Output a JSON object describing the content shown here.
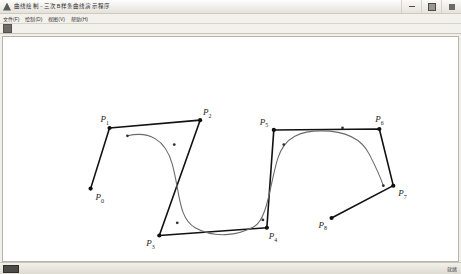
{
  "window": {
    "title": "曲线绘制 - 三次B样条曲线演示程序",
    "icon": "app-triangle-icon",
    "buttons": {
      "minimize": "最小化",
      "maximize": "最大化",
      "close": "关闭"
    }
  },
  "menubar": {
    "items": [
      {
        "label": "文件(F)",
        "name": "menu-file"
      },
      {
        "label": "绘制(D)",
        "name": "menu-draw"
      },
      {
        "label": "视图(V)",
        "name": "menu-view"
      },
      {
        "label": "帮助(H)",
        "name": "menu-help"
      }
    ]
  },
  "toolbar": {
    "buttons": [
      {
        "label": "绘制工具",
        "name": "toolbar-draw-tool"
      }
    ]
  },
  "statusbar": {
    "indicator_label": "",
    "right_text": "就绪"
  },
  "chart_data": {
    "type": "scatter",
    "title": "",
    "xlabel": "",
    "ylabel": "",
    "grid": false,
    "legend": null,
    "xlim": [
      0,
      457
    ],
    "ylim": [
      0,
      229
    ],
    "control_points": [
      {
        "label": "P",
        "sub": "0",
        "x": 88,
        "y": 155,
        "label_dx": 5,
        "label_dy": 12
      },
      {
        "label": "P",
        "sub": "1",
        "x": 107,
        "y": 93,
        "label_dx": -9,
        "label_dy": -6
      },
      {
        "label": "P",
        "sub": "2",
        "x": 198,
        "y": 85,
        "label_dx": 3,
        "label_dy": -5
      },
      {
        "label": "P",
        "sub": "3",
        "x": 157,
        "y": 203,
        "label_dx": -13,
        "label_dy": 11
      },
      {
        "label": "P",
        "sub": "4",
        "x": 265,
        "y": 195,
        "label_dx": 2,
        "label_dy": 12
      },
      {
        "label": "P",
        "sub": "5",
        "x": 272,
        "y": 95,
        "label_dx": -14,
        "label_dy": -5
      },
      {
        "label": "P",
        "sub": "6",
        "x": 378,
        "y": 94,
        "label_dx": -4,
        "label_dy": -7
      },
      {
        "label": "P",
        "sub": "7",
        "x": 392,
        "y": 152,
        "label_dx": 5,
        "label_dy": 11
      },
      {
        "label": "P",
        "sub": "8",
        "x": 330,
        "y": 185,
        "label_dx": -13,
        "label_dy": 10
      }
    ],
    "control_polygon_path": "M 88 155 L 107 93 L 198 85 L 157 203 L 265 195 L 272 95 L 378 94 L 392 152 L 330 185",
    "curve_path": "M 125 101 C 146 96 163 104 170 130 C 178 160 176 185 193 195 C 212 206 236 203 252 194 C 266 186 268 150 276 124 C 283 101 300 96 320 96 C 345 96 360 104 368 120 C 376 136 380 146 382 152",
    "curve_knot_markers": [
      {
        "x": 125,
        "y": 101
      },
      {
        "x": 172,
        "y": 110
      },
      {
        "x": 175,
        "y": 190
      },
      {
        "x": 261,
        "y": 187
      },
      {
        "x": 282,
        "y": 110
      },
      {
        "x": 341,
        "y": 93
      },
      {
        "x": 382,
        "y": 152
      }
    ],
    "curve_color": "#6b6b6b",
    "polygon_color": "#111111"
  }
}
